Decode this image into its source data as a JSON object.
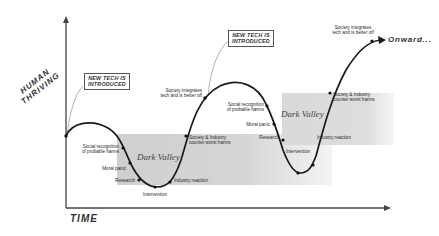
{
  "axes": {
    "y_label_line1": "HUMAN",
    "y_label_line2": "THRIVING",
    "x_label": "TIME"
  },
  "callouts": [
    {
      "line1": "NEW TECH IS",
      "line2": "INTRODUCED"
    },
    {
      "line1": "NEW TECH IS",
      "line2": "INTRODUCED"
    }
  ],
  "cycle1": {
    "valley_label": "Dark Valley",
    "social_recognition": {
      "line1": "Social recognition",
      "line2": "of probable harms"
    },
    "moral_panic": "Moral panic",
    "research": "Research",
    "intervention": "Intervention",
    "industry_reaction": "Industry reaction",
    "counter": {
      "line1": "Society & Industry",
      "line2": "counter worst harms"
    },
    "integrates": {
      "line1": "Society integrates",
      "line2": "tech and is better off"
    }
  },
  "cycle2": {
    "valley_label": "Dark Valley",
    "social_recognition": {
      "line1": "Social recognition",
      "line2": "of probable harms"
    },
    "moral_panic": "Moral panic",
    "research": "Research",
    "intervention": "Intervention",
    "industry_reaction": "Industry reaction",
    "counter": {
      "line1": "Society & Industry",
      "line2": "counter worst harms"
    },
    "integrates": {
      "line1": "Society integrates",
      "line2": "tech and is better off"
    }
  },
  "onward": "Onward...",
  "colors": {
    "curve": "#1a1a1a",
    "axis": "#444444",
    "shade": "#d4d4d4",
    "text": "#2a2a2a"
  }
}
